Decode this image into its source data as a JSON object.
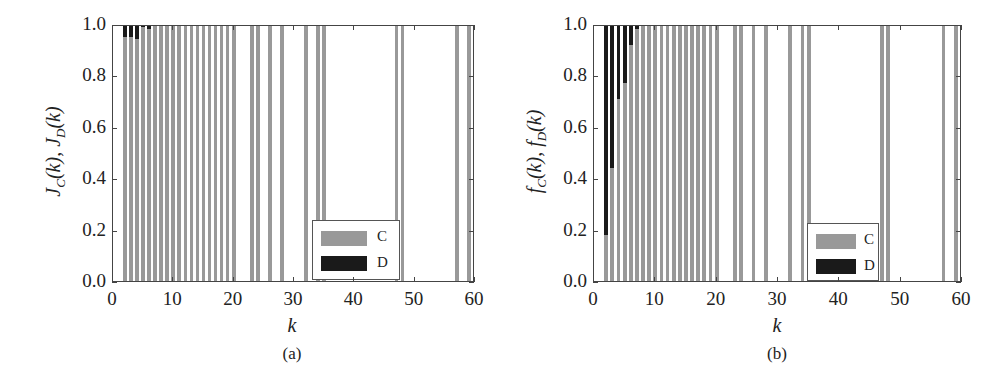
{
  "chart_data": [
    {
      "type": "bar",
      "stacked": true,
      "panel": "(a)",
      "title": "",
      "xlabel": "k",
      "ylabel": "J_C(k), J_D(k)",
      "xlim": [
        0,
        60
      ],
      "ylim": [
        0,
        1.0
      ],
      "xticks": [
        0,
        10,
        20,
        30,
        40,
        50,
        60
      ],
      "yticks": [
        0.0,
        0.2,
        0.4,
        0.6,
        0.8,
        1.0
      ],
      "legend": {
        "position": "lower right",
        "entries": [
          "C",
          "D"
        ]
      },
      "colors": {
        "C": "#999999",
        "D": "#1a1a1a"
      },
      "categories": [
        2,
        3,
        4,
        5,
        6,
        7,
        8,
        9,
        10,
        11,
        12,
        13,
        14,
        15,
        16,
        17,
        18,
        19,
        20,
        23,
        24,
        26,
        28,
        32,
        34,
        35,
        47,
        48,
        57,
        59
      ],
      "series": [
        {
          "name": "C",
          "values": [
            0.95,
            0.95,
            0.94,
            0.99,
            0.98,
            1,
            1,
            1,
            1,
            1,
            1,
            1,
            1,
            1,
            1,
            1,
            1,
            1,
            1,
            1,
            1,
            1,
            1,
            1,
            1,
            1,
            1,
            1,
            1,
            1
          ]
        },
        {
          "name": "D",
          "values": [
            0.05,
            0.05,
            0.06,
            0.01,
            0.02,
            0,
            0,
            0,
            0,
            0,
            0,
            0,
            0,
            0,
            0,
            0,
            0,
            0,
            0,
            0,
            0,
            0,
            0,
            0,
            0,
            0,
            0,
            0,
            0,
            0
          ]
        }
      ]
    },
    {
      "type": "bar",
      "stacked": true,
      "panel": "(b)",
      "title": "",
      "xlabel": "k",
      "ylabel": "f_C(k), f_D(k)",
      "xlim": [
        0,
        60
      ],
      "ylim": [
        0,
        1.0
      ],
      "xticks": [
        0,
        10,
        20,
        30,
        40,
        50,
        60
      ],
      "yticks": [
        0.0,
        0.2,
        0.4,
        0.6,
        0.8,
        1.0
      ],
      "legend": {
        "position": "lower right",
        "entries": [
          "C",
          "D"
        ]
      },
      "colors": {
        "C": "#999999",
        "D": "#1a1a1a"
      },
      "categories": [
        2,
        3,
        4,
        5,
        6,
        7,
        8,
        9,
        10,
        11,
        12,
        13,
        14,
        15,
        16,
        17,
        18,
        19,
        20,
        23,
        24,
        26,
        28,
        32,
        34,
        35,
        47,
        48,
        57,
        59
      ],
      "series": [
        {
          "name": "C",
          "values": [
            0.18,
            0.44,
            0.71,
            0.77,
            0.92,
            0.98,
            1,
            1,
            1,
            1,
            1,
            1,
            1,
            1,
            1,
            1,
            1,
            1,
            1,
            1,
            1,
            1,
            1,
            1,
            1,
            1,
            1,
            1,
            1,
            1
          ]
        },
        {
          "name": "D",
          "values": [
            0.82,
            0.56,
            0.29,
            0.23,
            0.08,
            0.02,
            0,
            0,
            0,
            0,
            0,
            0,
            0,
            0,
            0,
            0,
            0,
            0,
            0,
            0,
            0,
            0,
            0,
            0,
            0,
            0,
            0,
            0,
            0,
            0
          ]
        }
      ]
    }
  ],
  "panels": [
    {
      "caption": "(a)",
      "xlabel": "k",
      "ylabel_main": "J",
      "ylabel_sub_c": "C",
      "ylabel_sub_d": "D",
      "ylabel_arg": "(k)",
      "legend": {
        "c_label": "C",
        "d_label": "D"
      },
      "yticks": [
        "0.0",
        "0.2",
        "0.4",
        "0.6",
        "0.8",
        "1.0"
      ],
      "xticks": [
        "0",
        "10",
        "20",
        "30",
        "40",
        "50",
        "60"
      ]
    },
    {
      "caption": "(b)",
      "xlabel": "k",
      "ylabel_main": "f",
      "ylabel_sub_c": "C",
      "ylabel_sub_d": "D",
      "ylabel_arg": "(k)",
      "legend": {
        "c_label": "C",
        "d_label": "D"
      },
      "yticks": [
        "0.0",
        "0.2",
        "0.4",
        "0.6",
        "0.8",
        "1.0"
      ],
      "xticks": [
        "0",
        "10",
        "20",
        "30",
        "40",
        "50",
        "60"
      ]
    }
  ]
}
